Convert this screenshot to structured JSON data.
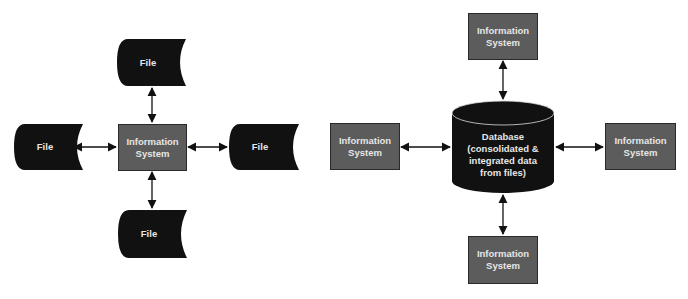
{
  "colors": {
    "file_fill": "#111111",
    "box_fill": "#5c5c5c",
    "box_border": "#2a2a2a",
    "database_fill": "#111111",
    "arrow": "#111111",
    "text": "#e6e6e6",
    "background": "#ffffff"
  },
  "left_diagram": {
    "center": {
      "label": "Information\nSystem"
    },
    "files": [
      {
        "position": "top",
        "label": "File"
      },
      {
        "position": "left",
        "label": "File"
      },
      {
        "position": "right",
        "label": "File"
      },
      {
        "position": "bottom",
        "label": "File"
      }
    ]
  },
  "right_diagram": {
    "database": {
      "label": "Database\n(consolidated &\nintegrated data\nfrom files)"
    },
    "systems": [
      {
        "position": "top",
        "label": "Information\nSystem"
      },
      {
        "position": "left",
        "label": "Information\nSystem"
      },
      {
        "position": "right",
        "label": "Information\nSystem"
      },
      {
        "position": "bottom",
        "label": "Information\nSystem"
      }
    ]
  }
}
